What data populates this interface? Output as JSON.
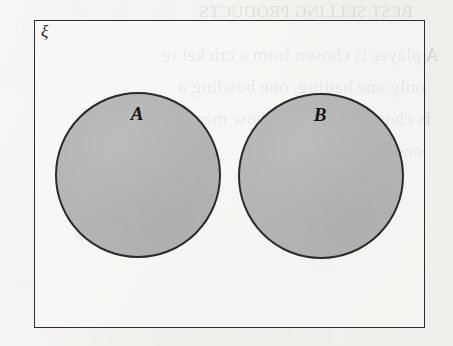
{
  "figure": {
    "kind": "venn-diagram",
    "universal_set_label": "ξ",
    "sets": [
      {
        "id": "a",
        "label": "A"
      },
      {
        "id": "b",
        "label": "B"
      }
    ],
    "overlap": "none"
  },
  "colors": {
    "circle_fill": "#b4b4b4",
    "circle_stroke": "#2a2a2a",
    "rect_stroke": "#2e2e2e",
    "page_background": "#f3f2ef",
    "label_text": "#141414"
  },
  "bleed_through": {
    "note": "mirrored show-through text from the reverse side of the scanned page",
    "top": "BEST SELLING PRODUCTS",
    "lines": [
      "A player is chosen from a cricket te",
      "only one batting, one bowling a",
      "is chosen at random, how many c",
      "one of these"
    ],
    "faint": "and"
  }
}
